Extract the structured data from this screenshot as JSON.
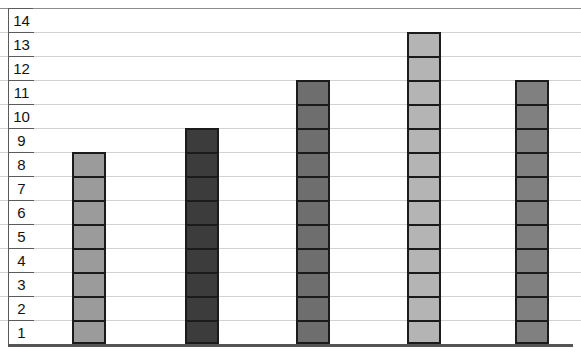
{
  "chart_data": {
    "type": "bar",
    "title": "",
    "xlabel": "",
    "ylabel": "",
    "categories": [
      "",
      "",
      "",
      "",
      ""
    ],
    "values": [
      8,
      9,
      11,
      13,
      11
    ],
    "ylim": [
      0,
      14
    ],
    "ytick_labels": [
      "14",
      "13",
      "12",
      "11",
      "10",
      "9",
      "8",
      "7",
      "6",
      "5",
      "4",
      "3",
      "2",
      "1"
    ],
    "grid": true,
    "legend": "none",
    "bar_colors": [
      "#9b9b9b",
      "#3c3c3c",
      "#6e6e6e",
      "#b4b4b4",
      "#808080"
    ],
    "bar_border_color": "#1b1b1b",
    "gridline_color": "#d2d2d2",
    "axis_color": "#555555",
    "background_color": "#ffffff",
    "note": "Each bar is drawn as stacked unit cells separated by dark horizontal rules; x-axis tick labels are cropped off the bottom edge of the screenshot."
  },
  "axis": {
    "y_ticks": [
      {
        "label": "14"
      },
      {
        "label": "13"
      },
      {
        "label": "12"
      },
      {
        "label": "11"
      },
      {
        "label": "10"
      },
      {
        "label": "9"
      },
      {
        "label": "8"
      },
      {
        "label": "7"
      },
      {
        "label": "6"
      },
      {
        "label": "5"
      },
      {
        "label": "4"
      },
      {
        "label": "3"
      },
      {
        "label": "2"
      },
      {
        "label": "1"
      }
    ]
  },
  "bars": [
    {
      "value": 8,
      "color": "#9b9b9b",
      "left": 72
    },
    {
      "value": 9,
      "color": "#3c3c3c",
      "left": 185
    },
    {
      "value": 11,
      "color": "#6e6e6e",
      "left": 296
    },
    {
      "value": 13,
      "color": "#b4b4b4",
      "left": 407
    },
    {
      "value": 11,
      "color": "#808080",
      "left": 515
    }
  ],
  "x_tick_marks": [
    {
      "label": "",
      "left": 100
    },
    {
      "label": "",
      "left": 210
    },
    {
      "label": "",
      "left": 320
    },
    {
      "label": "",
      "left": 430
    }
  ]
}
